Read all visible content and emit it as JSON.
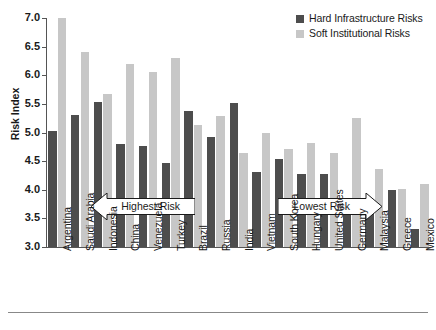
{
  "chart_data": {
    "type": "bar",
    "title": "",
    "xlabel": "",
    "ylabel": "Risk Index",
    "ylim": [
      3.0,
      7.0
    ],
    "yticks": [
      "3.0",
      "3.5",
      "4.0",
      "4.5",
      "5.0",
      "5.5",
      "6.0",
      "6.5",
      "7.0"
    ],
    "grid": false,
    "legend_position": "top-right",
    "categories": [
      "Argentina",
      "Saudi Arabia",
      "Indonesia",
      "China",
      "Venezuela",
      "Turkey",
      "Brazil",
      "Russia",
      "India",
      "Vietnam",
      "South Korea",
      "Hungary",
      "United States",
      "Germany",
      "Malaysia",
      "Greece",
      "Mexico"
    ],
    "series": [
      {
        "name": "Hard Infrastructure Risks",
        "color": "#4d4d4d",
        "values": [
          5.02,
          5.3,
          5.53,
          4.8,
          4.77,
          4.46,
          5.37,
          4.92,
          5.51,
          4.31,
          4.53,
          4.28,
          4.28,
          3.56,
          3.69,
          4.0,
          3.31
        ]
      },
      {
        "name": "Soft Institutional Risks",
        "color": "#c7c7c7",
        "values": [
          7.0,
          6.41,
          5.67,
          6.19,
          6.06,
          6.31,
          5.13,
          5.28,
          4.64,
          5.0,
          4.72,
          4.81,
          4.64,
          5.25,
          4.37,
          4.01,
          4.1
        ]
      }
    ],
    "annotations": [
      {
        "text": "Highest Risk",
        "direction": "left"
      },
      {
        "text": "Lowest Risk",
        "direction": "right"
      }
    ]
  }
}
